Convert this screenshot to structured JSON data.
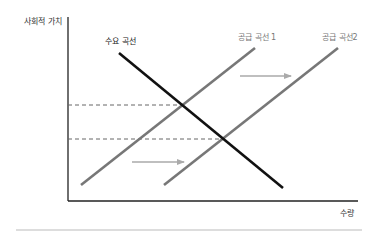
{
  "diagram": {
    "type": "supply-demand",
    "y_axis_label": "사회적 가치",
    "x_axis_label": "수량",
    "curves": [
      {
        "label": "수요 곡선",
        "color": "#111111"
      },
      {
        "label": "공급 곡선 1",
        "color": "#777777"
      },
      {
        "label": "공급 곡선2",
        "color": "#777777"
      }
    ],
    "annotations": [
      "supply shift arrow (right)",
      "supply shift arrow (right)"
    ],
    "colors": {
      "demand": "#111111",
      "supply": "#777777",
      "arrow": "#aaaaaa",
      "dashed": "#666666",
      "axis": "#222222",
      "separator": "#bbbbbb"
    }
  }
}
